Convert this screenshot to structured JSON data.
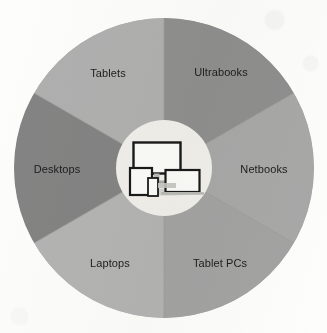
{
  "figure": {
    "background_color": "#fdfdfc"
  },
  "wheel": {
    "center_x": 164,
    "center_y": 168,
    "outer_radius": 150,
    "inner_radius": 48,
    "outer_ring_color": "#b2b2b2",
    "inner_circle_color": "#f0efeb",
    "divider_color": "#9d9d9d",
    "label_color": "#1d1d1d",
    "segments": [
      {
        "id": "ultrabooks",
        "label": "Ultrabooks",
        "color": "#8f8f8f",
        "start_angle": -90,
        "end_angle": -30,
        "label_x": 221,
        "label_y": 73
      },
      {
        "id": "netbooks",
        "label": "Netbooks",
        "color": "#a8a8a8",
        "start_angle": -30,
        "end_angle": 30,
        "label_x": 264,
        "label_y": 170
      },
      {
        "id": "tablet-pcs",
        "label": "Tablet PCs",
        "color": "#a3a3a3",
        "start_angle": 30,
        "end_angle": 90,
        "label_x": 220,
        "label_y": 264
      },
      {
        "id": "laptops",
        "label": "Laptops",
        "color": "#b4b4b4",
        "start_angle": 90,
        "end_angle": 150,
        "label_x": 110,
        "label_y": 264
      },
      {
        "id": "desktops",
        "label": "Desktops",
        "color": "#848484",
        "start_angle": 150,
        "end_angle": 210,
        "label_x": 57,
        "label_y": 170
      },
      {
        "id": "tablets",
        "label": "Tablets",
        "color": "#b0b0b0",
        "start_angle": 210,
        "end_angle": 270,
        "label_x": 108,
        "label_y": 74
      }
    ]
  },
  "center_icon": {
    "name": "devices-cluster-icon",
    "description": "Monitor, tablet, smartphone and laptop grouped together",
    "outline_color": "#1a1a1a",
    "screen_color": "#fbfbf9",
    "shadow_color": "#c9c9c5",
    "devices": [
      {
        "id": "monitor",
        "name": "desktop-monitor-icon"
      },
      {
        "id": "tablet",
        "name": "tablet-icon"
      },
      {
        "id": "phone",
        "name": "smartphone-icon"
      },
      {
        "id": "laptop",
        "name": "laptop-icon"
      }
    ]
  },
  "chart_data": {
    "type": "pie",
    "xlabel": "",
    "ylabel": "",
    "categories": [
      "Ultrabooks",
      "Netbooks",
      "Tablet PCs",
      "Laptops",
      "Desktops",
      "Tablets"
    ],
    "values": [
      60,
      60,
      60,
      60,
      60,
      60
    ],
    "unit": "degrees",
    "equal_slices": true,
    "slice_count": 6,
    "legend": "none",
    "grid": false,
    "colors": [
      "#8f8f8f",
      "#a8a8a8",
      "#a3a3a3",
      "#b4b4b4",
      "#848484",
      "#b0b0b0"
    ],
    "annotations": [
      "Center hub shows a cluster of device illustrations"
    ]
  }
}
